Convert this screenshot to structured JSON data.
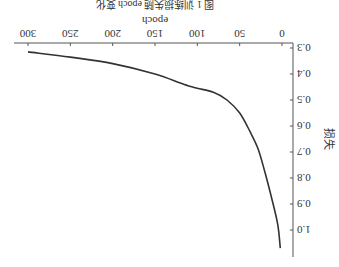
{
  "chart_data": {
    "type": "line",
    "title": "图 1  训练损失随 epoch 变化",
    "xlabel": "epoch",
    "ylabel": "损失",
    "xlim": [
      0,
      300
    ],
    "ylim": [
      0.3,
      1.1
    ],
    "x_ticks": [
      0,
      50,
      100,
      150,
      200,
      250,
      300
    ],
    "y_ticks": [
      0.3,
      0.4,
      0.5,
      0.6,
      0.7,
      0.8,
      0.9,
      1.0
    ],
    "grid": false,
    "legend": null,
    "orientation": "rotated 180 degrees",
    "series": [
      {
        "name": "loss",
        "color": "#333333",
        "x": [
          2,
          5,
          12,
          20,
          28,
          38,
          50,
          65,
          81,
          100,
          111,
          120,
          150,
          200,
          250,
          300
        ],
        "values": [
          1.07,
          0.98,
          0.88,
          0.78,
          0.69,
          0.62,
          0.55,
          0.5,
          0.47,
          0.455,
          0.445,
          0.435,
          0.4,
          0.36,
          0.335,
          0.315
        ]
      }
    ]
  },
  "labels": {
    "title": "图 1  训练损失随 epoch 变化",
    "xlabel": "epoch",
    "ylabel": "损失"
  }
}
